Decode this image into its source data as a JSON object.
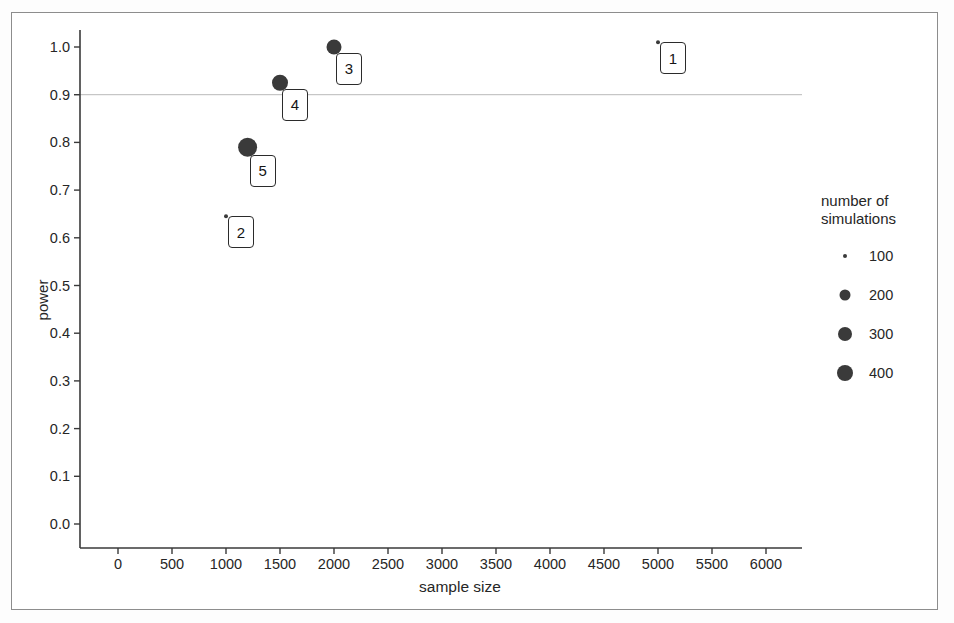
{
  "chart_data": {
    "type": "scatter",
    "title": "",
    "xlabel": "sample size",
    "ylabel": "power",
    "xlim": [
      0,
      6000
    ],
    "ylim": [
      0.0,
      1.0
    ],
    "grid": false,
    "reference_line": {
      "axis": "y",
      "value": 0.9,
      "color": "#b9b9b9"
    },
    "size_legend": {
      "title_line1": "number of",
      "title_line2": "simulations",
      "entries": [
        {
          "label": "100",
          "value": 100,
          "px": 4
        },
        {
          "label": "200",
          "value": 200,
          "px": 11
        },
        {
          "label": "300",
          "value": 300,
          "px": 14
        },
        {
          "label": "400",
          "value": 400,
          "px": 16
        }
      ]
    },
    "marker_color": "#3a3a3a",
    "xticks": [
      0,
      500,
      1000,
      1500,
      2000,
      2500,
      3000,
      3500,
      4000,
      4500,
      5000,
      5500,
      6000
    ],
    "xtick_labels": [
      "0",
      "500",
      "1000",
      "1500",
      "2000",
      "2500",
      "3000",
      "3500",
      "4000",
      "4500",
      "5000",
      "5500",
      "6000"
    ],
    "yticks": [
      0.0,
      0.1,
      0.2,
      0.3,
      0.4,
      0.5,
      0.6,
      0.7,
      0.8,
      0.9,
      1.0
    ],
    "ytick_labels": [
      "0.0",
      "0.1",
      "0.2",
      "0.3",
      "0.4",
      "0.5",
      "0.6",
      "0.7",
      "0.8",
      "0.9",
      "1.0"
    ],
    "points": [
      {
        "label": "1",
        "x": 5000,
        "y": 1.01,
        "simulations": 100,
        "px": 4
      },
      {
        "label": "2",
        "x": 1000,
        "y": 0.645,
        "simulations": 100,
        "px": 4
      },
      {
        "label": "3",
        "x": 2000,
        "y": 1.0,
        "simulations": 300,
        "px": 15
      },
      {
        "label": "4",
        "x": 1500,
        "y": 0.925,
        "simulations": 300,
        "px": 16
      },
      {
        "label": "5",
        "x": 1200,
        "y": 0.79,
        "simulations": 400,
        "px": 19
      }
    ]
  }
}
